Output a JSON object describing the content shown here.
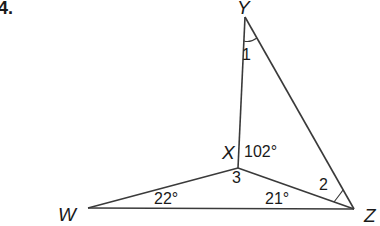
{
  "problem_number": "4.",
  "vertices": {
    "Y": {
      "label": "Y",
      "x": 245,
      "y": 17
    },
    "X": {
      "label": "X",
      "x": 238,
      "y": 168
    },
    "W": {
      "label": "W",
      "x": 88,
      "y": 208
    },
    "Z": {
      "label": "Z",
      "x": 354,
      "y": 209
    }
  },
  "segments": [
    [
      "Y",
      "X"
    ],
    [
      "Y",
      "Z"
    ],
    [
      "X",
      "W"
    ],
    [
      "X",
      "Z"
    ],
    [
      "W",
      "Z"
    ]
  ],
  "angle_labels": {
    "angle1": "1",
    "angle2": "2",
    "angle3": "3",
    "angle_YXZ": "102°",
    "angle_W": "22°",
    "angle_XZW": "21°"
  }
}
